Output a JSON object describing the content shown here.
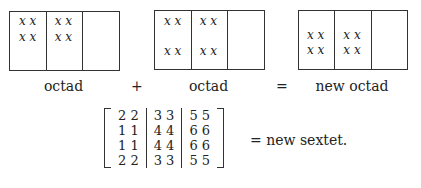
{
  "diagram": {
    "boxes": [
      {
        "label": "octad",
        "rows": [
          [
            "x x",
            "x x"
          ],
          [
            "x x",
            "x x"
          ]
        ],
        "layout": "top"
      },
      {
        "label": "octad",
        "rows": [
          [
            "x x",
            "x x"
          ],
          [
            "x x",
            "x x"
          ]
        ],
        "layout": "split"
      },
      {
        "label": "new octad",
        "rows": [
          [
            "x x",
            "x x"
          ],
          [
            "x x",
            "x x"
          ]
        ],
        "layout": "middle"
      }
    ],
    "operators": {
      "plus": "+",
      "equals": "="
    },
    "matrix": {
      "columns": [
        [
          "2 2",
          "1 1",
          "1 1",
          "2 2"
        ],
        [
          "3 3",
          "4 4",
          "4 4",
          "3 3"
        ],
        [
          "5 5",
          "6 6",
          "6 6",
          "5 5"
        ]
      ],
      "suffix": "= new sextet."
    }
  }
}
